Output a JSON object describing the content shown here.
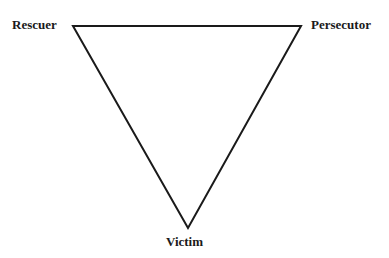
{
  "diagram": {
    "type": "triangle",
    "stroke_color": "#1a1a1a",
    "nodes": [
      {
        "id": "rescuer",
        "label": "Rescuer",
        "position": "top-left"
      },
      {
        "id": "persecutor",
        "label": "Persecutor",
        "position": "top-right"
      },
      {
        "id": "victim",
        "label": "Victim",
        "position": "bottom"
      }
    ],
    "edges": [
      {
        "from": "rescuer",
        "to": "persecutor"
      },
      {
        "from": "persecutor",
        "to": "victim"
      },
      {
        "from": "victim",
        "to": "rescuer"
      }
    ]
  }
}
